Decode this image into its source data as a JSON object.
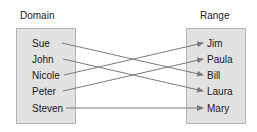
{
  "domain": {
    "label": "Domain",
    "items": [
      "Sue",
      "John",
      "Nicole",
      "Peter",
      "Steven"
    ]
  },
  "range": {
    "label": "Range",
    "items": [
      "Jim",
      "Paula",
      "Bill",
      "Laura",
      "Mary"
    ]
  },
  "mapping": [
    {
      "from": "Sue",
      "to": "Bill"
    },
    {
      "from": "John",
      "to": "Laura"
    },
    {
      "from": "Nicole",
      "to": "Jim"
    },
    {
      "from": "Peter",
      "to": "Paula"
    },
    {
      "from": "Steven",
      "to": "Mary"
    }
  ],
  "colors": {
    "box_fill": "#e2e2e2",
    "box_border": "#b4b4b4",
    "arrow": "#7a7a7a"
  }
}
